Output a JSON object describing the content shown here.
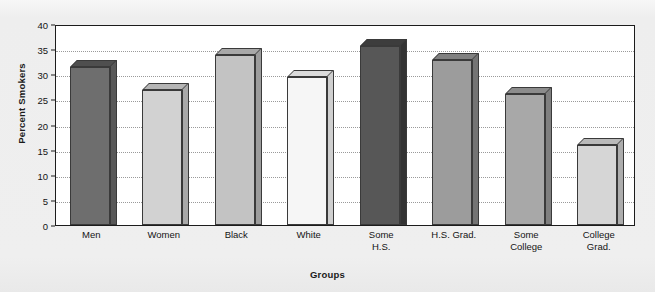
{
  "chart_data": {
    "type": "bar",
    "title": "",
    "xlabel": "Groups",
    "ylabel": "Percent Smokers",
    "categories": [
      "Men",
      "Women",
      "Black",
      "White",
      "Some H.S.",
      "H.S. Grad.",
      "Some College",
      "College Grad."
    ],
    "category_lines": [
      [
        "Men"
      ],
      [
        "Women"
      ],
      [
        "Black"
      ],
      [
        "White"
      ],
      [
        "Some",
        "H.S."
      ],
      [
        "H.S. Grad."
      ],
      [
        "Some",
        "College"
      ],
      [
        "College",
        "Grad."
      ]
    ],
    "values": [
      31.5,
      26.8,
      33.9,
      29.4,
      35.7,
      32.8,
      26.0,
      15.9
    ],
    "ylim": [
      0,
      40
    ],
    "yticks": [
      0,
      5,
      10,
      15,
      20,
      25,
      30,
      35,
      40
    ],
    "ytick_labels": [
      "0",
      "5",
      "10",
      "15",
      "20",
      "25",
      "30",
      "35",
      "40"
    ],
    "grid": true,
    "legend": "none",
    "bar_colors": [
      "#6e6e6e",
      "#d2d2d2",
      "#c3c3c3",
      "#f6f6f6",
      "#575757",
      "#9c9c9c",
      "#a8a8a8",
      "#d6d6d6"
    ],
    "bar_top_colors": [
      "#4f4f4f",
      "#b5b5b5",
      "#a8a8a8",
      "#dcdcdc",
      "#3d3d3d",
      "#808080",
      "#8c8c8c",
      "#bababa"
    ],
    "bar_side_colors": [
      "#585858",
      "#a9a9a9",
      "#9c9c9c",
      "#cfcfcf",
      "#333333",
      "#747474",
      "#7f7f7f",
      "#adadad"
    ]
  },
  "figure": {
    "plot_background": "#ffffff",
    "page_background": "#efefef",
    "frame_color": "#1c1c1c",
    "gridline_color": "#9a9a9a"
  }
}
